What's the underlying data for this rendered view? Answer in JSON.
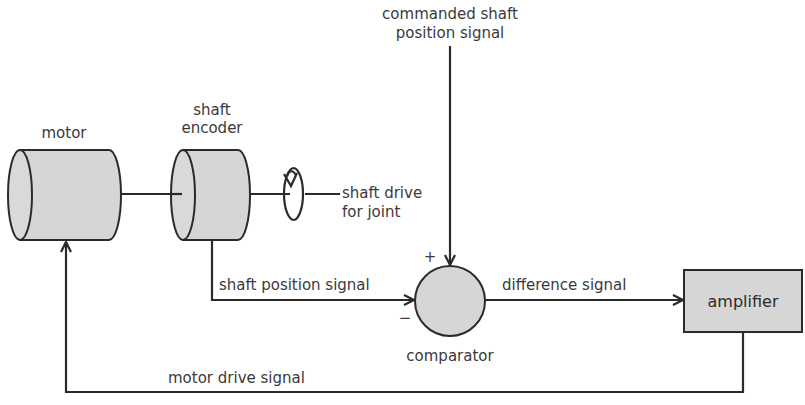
{
  "diagram": {
    "type": "closed-loop servo control block diagram",
    "colors": {
      "fill": "#d6d6d6",
      "stroke": "#2a2a2a",
      "text": "#3a3a3a",
      "background": "#ffffff"
    },
    "labels": {
      "motor": "motor",
      "shaft_encoder_line1": "shaft",
      "shaft_encoder_line2": "encoder",
      "shaft_drive_line1": "shaft drive",
      "shaft_drive_line2": "for joint",
      "commanded_line1": "commanded shaft",
      "commanded_line2": "position signal",
      "plus_sign": "+",
      "minus_sign": "−",
      "shaft_position_signal": "shaft position signal",
      "comparator": "comparator",
      "difference_signal": "difference signal",
      "amplifier": "amplifier",
      "motor_drive_signal": "motor drive signal"
    },
    "nodes": [
      {
        "id": "motor",
        "label": "motor",
        "shape": "cylinder"
      },
      {
        "id": "shaft_encoder",
        "label": "shaft encoder",
        "shape": "cylinder"
      },
      {
        "id": "shaft_drive",
        "label": "shaft drive for joint",
        "shape": "rotation-symbol"
      },
      {
        "id": "comparator",
        "label": "comparator",
        "shape": "circle"
      },
      {
        "id": "amplifier",
        "label": "amplifier",
        "shape": "rectangle"
      }
    ],
    "edges": [
      {
        "from": "motor",
        "to": "shaft_encoder",
        "label": ""
      },
      {
        "from": "shaft_encoder",
        "to": "shaft_drive",
        "label": ""
      },
      {
        "from": "commanded_input",
        "to": "comparator",
        "label": "commanded shaft position signal",
        "sign": "+"
      },
      {
        "from": "shaft_encoder",
        "to": "comparator",
        "label": "shaft position signal",
        "sign": "−"
      },
      {
        "from": "comparator",
        "to": "amplifier",
        "label": "difference signal"
      },
      {
        "from": "amplifier",
        "to": "motor",
        "label": "motor drive signal"
      }
    ]
  }
}
